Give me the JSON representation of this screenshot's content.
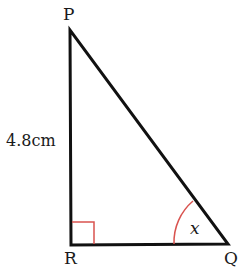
{
  "diagram": {
    "type": "right-triangle",
    "vertices": {
      "P": {
        "label": "P",
        "x": 70,
        "y": 30
      },
      "R": {
        "label": "R",
        "x": 71,
        "y": 245
      },
      "Q": {
        "label": "Q",
        "x": 228,
        "y": 244
      }
    },
    "side_label": "4.8cm",
    "angle_label": "x",
    "right_angle_at": "R",
    "marked_angle_at": "Q",
    "colors": {
      "lines": "#111111",
      "marks": "#d9534f"
    }
  }
}
